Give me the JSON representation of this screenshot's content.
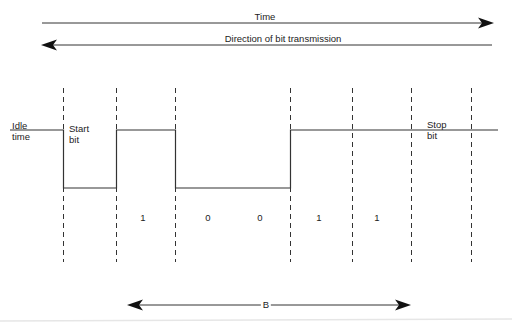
{
  "diagram": {
    "type": "asynchronous serial bit frame timing diagram",
    "time_arrow": {
      "label": "Time",
      "direction": "right"
    },
    "transmission_arrow": {
      "label": "Direction of bit transmission",
      "direction": "left"
    },
    "idle_label": {
      "line1": "Idle",
      "line2": "time"
    },
    "start_bit_label": {
      "line1": "Start",
      "line2": "bit"
    },
    "stop_bit_label": {
      "line1": "Stop",
      "line2": "bit"
    },
    "bits": [
      {
        "value": "1"
      },
      {
        "value": "0"
      },
      {
        "value": "0"
      },
      {
        "value": "1"
      },
      {
        "value": "1"
      }
    ],
    "span_arrow": {
      "label": "B"
    },
    "signal_levels": [
      "high",
      "low",
      "high",
      "low",
      "low",
      "high",
      "high",
      "high"
    ],
    "colors": {
      "line": "#222222",
      "background": "#ffffff",
      "divider": "#e6e6e6"
    }
  }
}
